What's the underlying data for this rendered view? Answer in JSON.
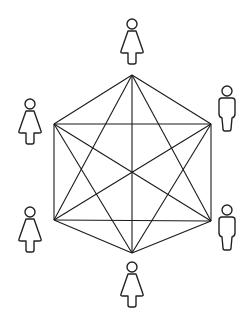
{
  "diagram": {
    "type": "complete-graph",
    "node_count": 6,
    "nodes": [
      {
        "id": "top",
        "person": "female",
        "icon": "female-person-icon"
      },
      {
        "id": "upper-right",
        "person": "male",
        "icon": "male-person-icon"
      },
      {
        "id": "lower-right",
        "person": "male",
        "icon": "male-person-icon"
      },
      {
        "id": "bottom",
        "person": "female",
        "icon": "female-person-icon"
      },
      {
        "id": "lower-left",
        "person": "female",
        "icon": "female-person-icon"
      },
      {
        "id": "upper-left",
        "person": "female",
        "icon": "female-person-icon"
      }
    ],
    "edges": [
      [
        "top",
        "upper-right"
      ],
      [
        "top",
        "lower-right"
      ],
      [
        "top",
        "bottom"
      ],
      [
        "top",
        "lower-left"
      ],
      [
        "top",
        "upper-left"
      ],
      [
        "upper-right",
        "lower-right"
      ],
      [
        "upper-right",
        "bottom"
      ],
      [
        "upper-right",
        "lower-left"
      ],
      [
        "upper-right",
        "upper-left"
      ],
      [
        "lower-right",
        "bottom"
      ],
      [
        "lower-right",
        "lower-left"
      ],
      [
        "lower-right",
        "upper-left"
      ],
      [
        "bottom",
        "lower-left"
      ],
      [
        "bottom",
        "upper-left"
      ],
      [
        "lower-left",
        "upper-left"
      ]
    ],
    "colors": {
      "line": "#1a1a1a",
      "background": "#ffffff"
    }
  }
}
